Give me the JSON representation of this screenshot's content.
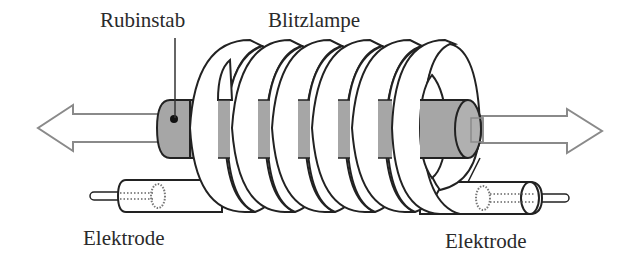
{
  "diagram": {
    "labels": {
      "rod": "Rubinstab",
      "lamp": "Blitzlampe",
      "electrode_left": "Elektrode",
      "electrode_right": "Elektrode"
    },
    "components": [
      {
        "id": "ruby-rod",
        "name": "Rubinstab",
        "color": "#a6a6a6"
      },
      {
        "id": "flash-lamp",
        "name": "Blitzlampe",
        "turns": 6,
        "color": "#ffffff"
      },
      {
        "id": "electrode-left",
        "name": "Elektrode"
      },
      {
        "id": "electrode-right",
        "name": "Elektrode"
      },
      {
        "id": "arrow-left",
        "name": "Laserstrahl links"
      },
      {
        "id": "arrow-right",
        "name": "Laserstrahl rechts"
      }
    ],
    "colors": {
      "stroke": "#222222",
      "rod_fill": "#a6a6a6",
      "arrow_stroke": "#8a8a8a",
      "background": "#ffffff",
      "text": "#2a2a2a"
    }
  }
}
